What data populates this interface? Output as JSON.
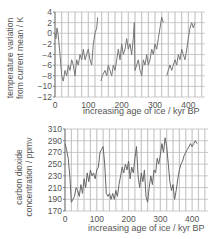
{
  "chart_data": [
    {
      "type": "line",
      "title": "",
      "ylabel": "temperature variation from current mean / K",
      "ylabel_lines": [
        "temperature variation",
        "from current mean / K"
      ],
      "xlabel": "increasing age of ice / kyr BP",
      "xlim": [
        0,
        450
      ],
      "ylim": [
        -12,
        4
      ],
      "xticks": [
        0,
        100,
        200,
        300,
        400
      ],
      "yticks": [
        4,
        2,
        0,
        -2,
        -4,
        -6,
        -8,
        -10,
        -12
      ],
      "grid": true,
      "line_color": "#777777",
      "x": [
        0,
        3,
        6,
        9,
        12,
        15,
        20,
        25,
        30,
        35,
        40,
        45,
        50,
        55,
        60,
        65,
        70,
        75,
        80,
        85,
        90,
        95,
        100,
        105,
        110,
        115,
        120,
        125,
        128,
        138,
        142,
        150,
        155,
        160,
        165,
        170,
        175,
        180,
        185,
        190,
        195,
        200,
        205,
        210,
        215,
        220,
        225,
        230,
        235,
        238,
        240,
        245,
        250,
        255,
        260,
        265,
        270,
        275,
        280,
        285,
        290,
        295,
        300,
        305,
        310,
        315,
        320,
        325,
        335,
        340,
        345,
        350,
        355,
        360,
        365,
        370,
        375,
        380,
        385,
        390,
        395,
        400,
        405,
        410,
        415,
        420
      ],
      "values": [
        0,
        -1,
        1,
        0,
        -2,
        -4,
        -8,
        -9,
        -7,
        -8,
        -6,
        -7,
        -5,
        -6,
        -8,
        -5,
        -6,
        -4,
        -5,
        -3,
        -5,
        -4,
        -3,
        -5,
        -6,
        -2,
        0,
        1,
        3,
        -9,
        -8,
        -7,
        -8,
        -6,
        -7,
        -8,
        -6,
        -7,
        -5,
        -3,
        -5,
        -2,
        -4,
        -3,
        -1,
        -3,
        -2,
        -4,
        -1,
        2,
        -7,
        -6,
        -5,
        -7,
        -8,
        -5,
        -6,
        -4,
        -6,
        -5,
        -3,
        -4,
        -2,
        -3,
        -1,
        1,
        3,
        2,
        -8,
        -7,
        -6,
        -7,
        -6,
        -5,
        -6,
        -4,
        -5,
        -3,
        -4,
        -5,
        -3,
        -1,
        1,
        2,
        1,
        2
      ]
    },
    {
      "type": "line",
      "title": "",
      "ylabel": "carbon dioxide concentration / ppmv",
      "ylabel_lines": [
        "carbon dioxide",
        "concentration / ppmv"
      ],
      "xlabel": "increasing age of ice / kyr BP",
      "xlim": [
        0,
        450
      ],
      "ylim": [
        170,
        310
      ],
      "xticks": [
        0,
        100,
        200,
        300,
        400
      ],
      "yticks": [
        310,
        290,
        270,
        250,
        230,
        210,
        190,
        170
      ],
      "grid": true,
      "line_color": "#666666",
      "x": [
        0,
        5,
        10,
        15,
        20,
        25,
        30,
        35,
        40,
        45,
        50,
        55,
        60,
        65,
        70,
        75,
        80,
        85,
        90,
        95,
        100,
        105,
        110,
        115,
        120,
        125,
        130,
        135,
        140,
        145,
        150,
        155,
        160,
        165,
        170,
        175,
        180,
        185,
        190,
        195,
        200,
        205,
        210,
        215,
        220,
        225,
        230,
        235,
        240,
        245,
        250,
        255,
        260,
        265,
        270,
        275,
        280,
        285,
        290,
        295,
        300,
        305,
        310,
        315,
        320,
        325,
        330,
        335,
        340,
        345,
        350,
        355,
        360,
        365,
        370,
        375,
        380,
        385,
        390,
        395,
        400,
        405,
        410,
        415
      ],
      "values": [
        285,
        275,
        260,
        230,
        185,
        190,
        195,
        210,
        205,
        195,
        215,
        200,
        225,
        210,
        235,
        220,
        240,
        230,
        235,
        225,
        240,
        245,
        270,
        275,
        280,
        250,
        200,
        195,
        200,
        190,
        200,
        190,
        205,
        195,
        215,
        230,
        245,
        235,
        250,
        240,
        255,
        225,
        245,
        235,
        260,
        280,
        230,
        210,
        235,
        220,
        240,
        195,
        185,
        210,
        230,
        215,
        240,
        235,
        260,
        250,
        265,
        285,
        270,
        295,
        280,
        250,
        220,
        205,
        215,
        190,
        205,
        225,
        240,
        250,
        255,
        265,
        270,
        275,
        280,
        285,
        280,
        285,
        290,
        285
      ]
    }
  ]
}
